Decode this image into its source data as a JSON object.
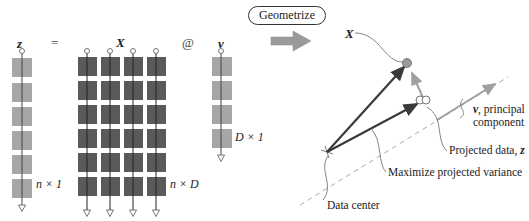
{
  "equation": {
    "z_label": "z",
    "equals": "=",
    "X_label": "X",
    "matmul": "@",
    "v_label": "v",
    "z_dims": "n × 1",
    "X_dims": "n × D",
    "v_dims": "D × 1",
    "z_rows": 6,
    "X_rows": 6,
    "X_cols": 4,
    "v_rows": 4
  },
  "button": {
    "label": "Geometrize"
  },
  "geometry": {
    "X_point_label": "X",
    "principal_label_var": "v",
    "principal_label_rest": ", principal",
    "principal_label_line2": "component",
    "projected_label_text": "Projected data, ",
    "projected_label_var": "z",
    "variance_label": "Maximize projected variance",
    "center_label": "Data center"
  },
  "colors": {
    "light_block": "#a6a6a6",
    "dark_block": "#5a5a5a",
    "arrow_dark": "#3a3a3a",
    "arrow_light": "#a0a0a0",
    "point_fill": "#999999"
  }
}
